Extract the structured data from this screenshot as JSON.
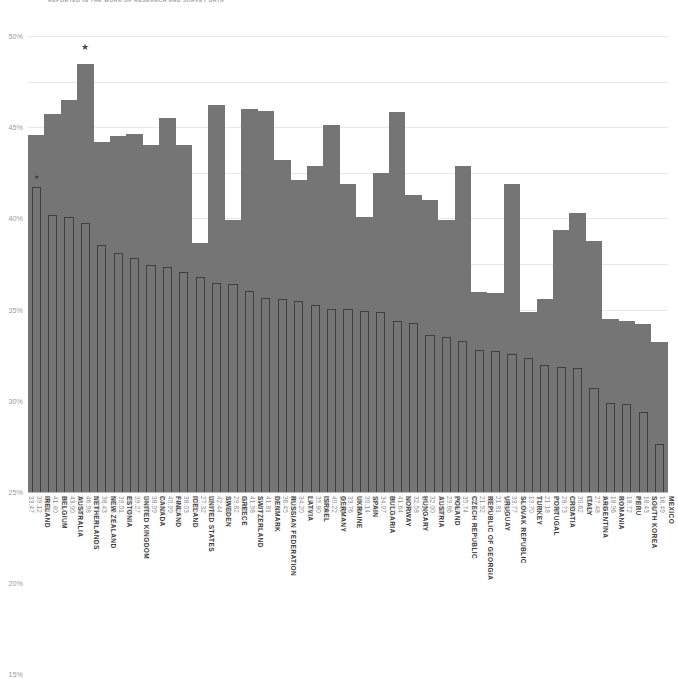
{
  "chart_data": {
    "type": "bar",
    "title": "REPORTED IN THE WORK OF RESEARCH AND SURVEY DATA",
    "xlabel": "",
    "ylabel": "",
    "ylim": [
      0,
      50
    ],
    "ytick_labels": [
      "50%",
      "45%",
      "40%",
      "35%",
      "30%",
      "25%",
      "20%",
      "15%",
      "10%",
      "5%",
      "0"
    ],
    "ytick_values": [
      50,
      45,
      40,
      35,
      30,
      25,
      20,
      15,
      10,
      5,
      0
    ],
    "grid": true,
    "legend_position": "none",
    "categories": [
      "IRELAND",
      "BELGIUM",
      "AUSTRALIA",
      "NETHERLANDS",
      "NEW ZEALAND",
      "ESTONIA",
      "UNITED KINGDOM",
      "CANADA",
      "FINLAND",
      "ICELAND",
      "UNITED STATES",
      "SWEDEN",
      "GREECE",
      "SWITZERLAND",
      "DENMARK",
      "RUSSIAN FEDERATION",
      "LATVIA",
      "ISRAEL",
      "GERMANY",
      "UKRAINE",
      "SPAIN",
      "BULGARIA",
      "NORWAY",
      "HUNGARY",
      "AUSTRIA",
      "POLAND",
      "CZECH REPUBLIC",
      "REPUBLIC OF GEORGIA",
      "URUGUAY",
      "SLOVAK REPUBLIC",
      "TURKEY",
      "PORTUGAL",
      "CROATIA",
      "ITALY",
      "ARGENTINA",
      "ROMANIA",
      "PERU",
      "SOUTH KOREA",
      "MEXICO"
    ],
    "series": [
      {
        "name": "front",
        "values": [
          33.47,
          30.41,
          30.14,
          29.54,
          27.07,
          26.23,
          25.7,
          24.86,
          24.66,
          24.12,
          23.55,
          22.93,
          22.81,
          22.05,
          21.29,
          21.2,
          20.94,
          20.48,
          20.09,
          20.09,
          19.81,
          19.76,
          18.77,
          18.5,
          17.2,
          17.01,
          16.6,
          15.54,
          15.45,
          15.08,
          14.74,
          13.91,
          13.74,
          13.59,
          11.43,
          9.76,
          9.67,
          8.8,
          5.28
        ]
      },
      {
        "name": "back",
        "values": [
          39.12,
          41.4,
          43.0,
          46.98,
          38.43,
          39.01,
          39.27,
          38.09,
          40.99,
          38.03,
          27.32,
          42.44,
          29.82,
          41.98,
          41.81,
          36.45,
          34.2,
          35.8,
          40.22,
          33.76,
          30.14,
          34.97,
          41.64,
          32.58,
          32.0,
          29.86,
          35.74,
          21.92,
          21.81,
          33.77,
          19.7,
          21.18,
          28.73,
          30.62,
          27.48,
          18.96,
          18.72,
          18.43,
          16.49
        ]
      }
    ],
    "markers": [
      {
        "category": "IRELAND",
        "glyph": "★",
        "size": "small"
      },
      {
        "category": "NETHERLANDS",
        "glyph": "★",
        "size": "large"
      }
    ],
    "colors": {
      "back_bar": "#757575",
      "front_bar_outline": "#3f3f3f",
      "grid": "#e8e8e8",
      "axis": "#b9b9b9",
      "tick_text": "#9b9b9b",
      "label_text": "#3c3c3c",
      "value_text": "#8d8d8d",
      "background": "#ffffff"
    }
  }
}
